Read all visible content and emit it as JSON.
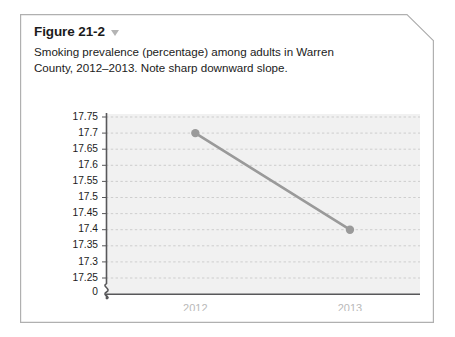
{
  "figure": {
    "title": "Figure 21-2",
    "caret_icon": "chevron-down-icon",
    "caption": "Smoking prevalence (percentage) among adults in Warren County, 2012–2013. Note sharp downward slope."
  },
  "colors": {
    "card_border": "#b0b0b0",
    "plot_background": "#f1f1f1",
    "gridline": "#c9c9c9",
    "axis": "#58585a",
    "series_line": "#9a9a9a",
    "series_marker": "#9a9a9a",
    "xtick_label": "#b9b9b9",
    "ytick_label": "#1b1b1b",
    "caret": "#b4b4b4"
  },
  "chart_data": {
    "type": "line",
    "title": "",
    "xlabel": "",
    "ylabel": "",
    "categories": [
      "2012",
      "2013"
    ],
    "x": [
      "2012",
      "2013"
    ],
    "series": [
      {
        "name": "Smoking prevalence (%)",
        "values": [
          17.7,
          17.4
        ]
      }
    ],
    "ylim": [
      17.2,
      17.78
    ],
    "yticks": [
      "17.75",
      "17.7",
      "17.65",
      "17.6",
      "17.55",
      "17.5",
      "17.45",
      "17.4",
      "17.35",
      "17.3",
      "17.25"
    ],
    "ytick_values": [
      17.75,
      17.7,
      17.65,
      17.6,
      17.55,
      17.5,
      17.45,
      17.4,
      17.35,
      17.3,
      17.25
    ],
    "axis_break": true,
    "axis_break_label": "0",
    "grid": true,
    "grid_style": "dashed",
    "legend": "none"
  }
}
